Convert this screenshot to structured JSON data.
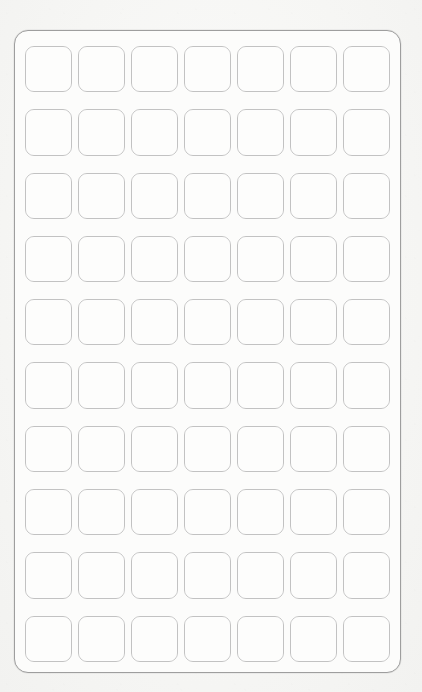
{
  "document": {
    "kind": "blank-label-sheet",
    "title": "",
    "background_color": "#f7f7f6",
    "paper_color": "#fcfcfb",
    "frame_border_color": "#9e9e9e",
    "label_border_color": "#c2c2c2",
    "label_fill_color": "#fdfdfc"
  },
  "sheet": {
    "columns": 7,
    "rows": 10,
    "total_labels": 70,
    "labels": [
      {
        "row": 1,
        "col": 1,
        "text": ""
      },
      {
        "row": 1,
        "col": 2,
        "text": ""
      },
      {
        "row": 1,
        "col": 3,
        "text": ""
      },
      {
        "row": 1,
        "col": 4,
        "text": ""
      },
      {
        "row": 1,
        "col": 5,
        "text": ""
      },
      {
        "row": 1,
        "col": 6,
        "text": ""
      },
      {
        "row": 1,
        "col": 7,
        "text": ""
      },
      {
        "row": 2,
        "col": 1,
        "text": ""
      },
      {
        "row": 2,
        "col": 2,
        "text": ""
      },
      {
        "row": 2,
        "col": 3,
        "text": ""
      },
      {
        "row": 2,
        "col": 4,
        "text": ""
      },
      {
        "row": 2,
        "col": 5,
        "text": ""
      },
      {
        "row": 2,
        "col": 6,
        "text": ""
      },
      {
        "row": 2,
        "col": 7,
        "text": ""
      },
      {
        "row": 3,
        "col": 1,
        "text": ""
      },
      {
        "row": 3,
        "col": 2,
        "text": ""
      },
      {
        "row": 3,
        "col": 3,
        "text": ""
      },
      {
        "row": 3,
        "col": 4,
        "text": ""
      },
      {
        "row": 3,
        "col": 5,
        "text": ""
      },
      {
        "row": 3,
        "col": 6,
        "text": ""
      },
      {
        "row": 3,
        "col": 7,
        "text": ""
      },
      {
        "row": 4,
        "col": 1,
        "text": ""
      },
      {
        "row": 4,
        "col": 2,
        "text": ""
      },
      {
        "row": 4,
        "col": 3,
        "text": ""
      },
      {
        "row": 4,
        "col": 4,
        "text": ""
      },
      {
        "row": 4,
        "col": 5,
        "text": ""
      },
      {
        "row": 4,
        "col": 6,
        "text": ""
      },
      {
        "row": 4,
        "col": 7,
        "text": ""
      },
      {
        "row": 5,
        "col": 1,
        "text": ""
      },
      {
        "row": 5,
        "col": 2,
        "text": ""
      },
      {
        "row": 5,
        "col": 3,
        "text": ""
      },
      {
        "row": 5,
        "col": 4,
        "text": ""
      },
      {
        "row": 5,
        "col": 5,
        "text": ""
      },
      {
        "row": 5,
        "col": 6,
        "text": ""
      },
      {
        "row": 5,
        "col": 7,
        "text": ""
      },
      {
        "row": 6,
        "col": 1,
        "text": ""
      },
      {
        "row": 6,
        "col": 2,
        "text": ""
      },
      {
        "row": 6,
        "col": 3,
        "text": ""
      },
      {
        "row": 6,
        "col": 4,
        "text": ""
      },
      {
        "row": 6,
        "col": 5,
        "text": ""
      },
      {
        "row": 6,
        "col": 6,
        "text": ""
      },
      {
        "row": 6,
        "col": 7,
        "text": ""
      },
      {
        "row": 7,
        "col": 1,
        "text": ""
      },
      {
        "row": 7,
        "col": 2,
        "text": ""
      },
      {
        "row": 7,
        "col": 3,
        "text": ""
      },
      {
        "row": 7,
        "col": 4,
        "text": ""
      },
      {
        "row": 7,
        "col": 5,
        "text": ""
      },
      {
        "row": 7,
        "col": 6,
        "text": ""
      },
      {
        "row": 7,
        "col": 7,
        "text": ""
      },
      {
        "row": 8,
        "col": 1,
        "text": ""
      },
      {
        "row": 8,
        "col": 2,
        "text": ""
      },
      {
        "row": 8,
        "col": 3,
        "text": ""
      },
      {
        "row": 8,
        "col": 4,
        "text": ""
      },
      {
        "row": 8,
        "col": 5,
        "text": ""
      },
      {
        "row": 8,
        "col": 6,
        "text": ""
      },
      {
        "row": 8,
        "col": 7,
        "text": ""
      },
      {
        "row": 9,
        "col": 1,
        "text": ""
      },
      {
        "row": 9,
        "col": 2,
        "text": ""
      },
      {
        "row": 9,
        "col": 3,
        "text": ""
      },
      {
        "row": 9,
        "col": 4,
        "text": ""
      },
      {
        "row": 9,
        "col": 5,
        "text": ""
      },
      {
        "row": 9,
        "col": 6,
        "text": ""
      },
      {
        "row": 9,
        "col": 7,
        "text": ""
      },
      {
        "row": 10,
        "col": 1,
        "text": ""
      },
      {
        "row": 10,
        "col": 2,
        "text": ""
      },
      {
        "row": 10,
        "col": 3,
        "text": ""
      },
      {
        "row": 10,
        "col": 4,
        "text": ""
      },
      {
        "row": 10,
        "col": 5,
        "text": ""
      },
      {
        "row": 10,
        "col": 6,
        "text": ""
      },
      {
        "row": 10,
        "col": 7,
        "text": ""
      }
    ]
  }
}
